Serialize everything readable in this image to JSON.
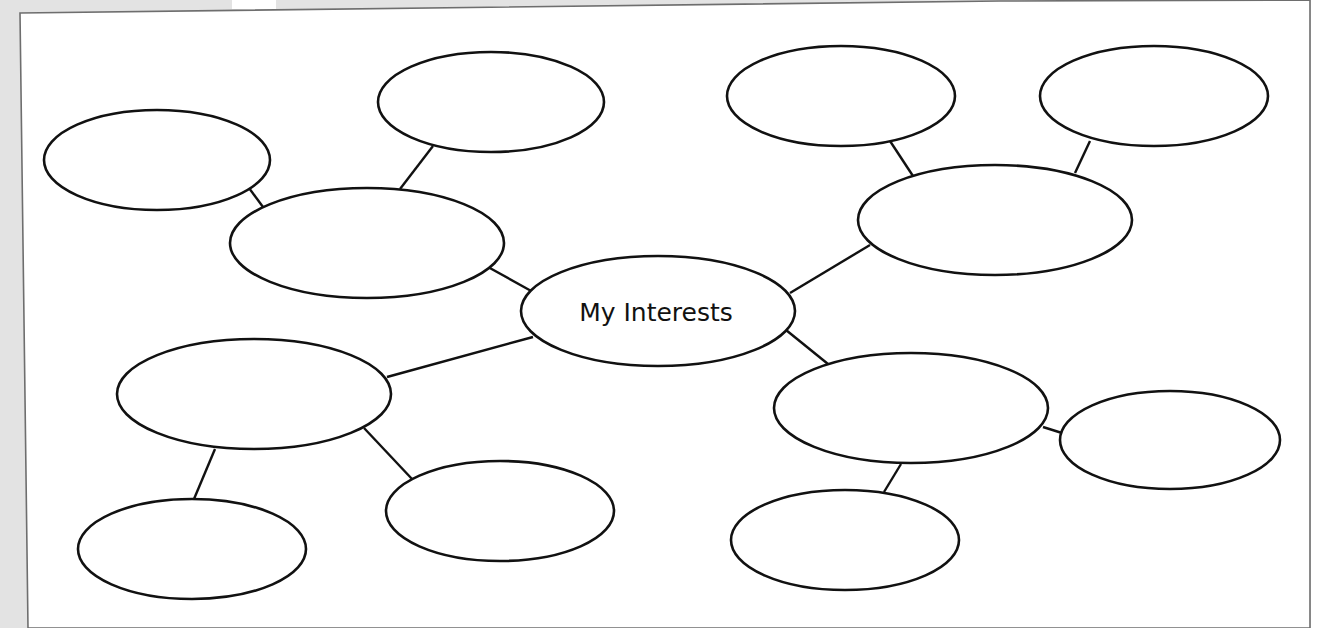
{
  "worksheet": {
    "title": "My Interests",
    "paper_color": "#ffffff",
    "background_color": "#e3e3e3",
    "stroke_color": "#111111"
  },
  "center_node": {
    "label": "My Interests",
    "cx": 658,
    "cy": 311,
    "rx": 137,
    "ry": 55
  },
  "nodes": [
    {
      "id": "top-left",
      "cx": 157,
      "cy": 160,
      "rx": 113,
      "ry": 50,
      "label": ""
    },
    {
      "id": "top-middle",
      "cx": 491,
      "cy": 102,
      "rx": 113,
      "ry": 50,
      "label": ""
    },
    {
      "id": "upper-left-branch",
      "cx": 367,
      "cy": 243,
      "rx": 137,
      "ry": 55,
      "label": ""
    },
    {
      "id": "top-right-a",
      "cx": 841,
      "cy": 96,
      "rx": 114,
      "ry": 50,
      "label": ""
    },
    {
      "id": "top-right-b",
      "cx": 1154,
      "cy": 96,
      "rx": 114,
      "ry": 50,
      "label": ""
    },
    {
      "id": "upper-right-branch",
      "cx": 995,
      "cy": 220,
      "rx": 137,
      "ry": 55,
      "label": ""
    },
    {
      "id": "lower-left-branch",
      "cx": 254,
      "cy": 394,
      "rx": 137,
      "ry": 55,
      "label": ""
    },
    {
      "id": "bottom-left",
      "cx": 192,
      "cy": 549,
      "rx": 114,
      "ry": 50,
      "label": ""
    },
    {
      "id": "bottom-center-left",
      "cx": 500,
      "cy": 511,
      "rx": 114,
      "ry": 50,
      "label": ""
    },
    {
      "id": "lower-right-branch",
      "cx": 911,
      "cy": 408,
      "rx": 137,
      "ry": 55,
      "label": ""
    },
    {
      "id": "far-right",
      "cx": 1170,
      "cy": 440,
      "rx": 110,
      "ry": 49,
      "label": ""
    },
    {
      "id": "bottom-right",
      "cx": 845,
      "cy": 540,
      "rx": 114,
      "ry": 50,
      "label": ""
    }
  ],
  "connectors": [
    {
      "from": "upper-left-branch",
      "to": "center",
      "x1": 488,
      "y1": 267,
      "x2": 533,
      "y2": 292
    },
    {
      "from": "lower-left-branch",
      "to": "center",
      "x1": 387,
      "y1": 377,
      "x2": 533,
      "y2": 337
    },
    {
      "from": "center",
      "to": "upper-right-branch",
      "x1": 790,
      "y1": 293,
      "x2": 870,
      "y2": 245
    },
    {
      "from": "center",
      "to": "lower-right-branch",
      "x1": 786,
      "y1": 330,
      "x2": 828,
      "y2": 364
    },
    {
      "from": "top-left",
      "to": "upper-left-branch",
      "x1": 246,
      "y1": 184,
      "x2": 263,
      "y2": 207
    },
    {
      "from": "top-middle",
      "to": "upper-left-branch",
      "x1": 433,
      "y1": 146,
      "x2": 400,
      "y2": 189
    },
    {
      "from": "top-right-a",
      "to": "upper-right-branch",
      "x1": 890,
      "y1": 141,
      "x2": 913,
      "y2": 176
    },
    {
      "from": "top-right-b",
      "to": "upper-right-branch",
      "x1": 1090,
      "y1": 141,
      "x2": 1075,
      "y2": 173
    },
    {
      "from": "lower-left-branch",
      "to": "bottom-left",
      "x1": 215,
      "y1": 449,
      "x2": 194,
      "y2": 499
    },
    {
      "from": "lower-left-branch",
      "to": "bottom-center-left",
      "x1": 364,
      "y1": 428,
      "x2": 412,
      "y2": 479
    },
    {
      "from": "lower-right-branch",
      "to": "far-right",
      "x1": 1043,
      "y1": 427,
      "x2": 1062,
      "y2": 433
    },
    {
      "from": "lower-right-branch",
      "to": "bottom-right",
      "x1": 901,
      "y1": 464,
      "x2": 884,
      "y2": 492
    }
  ]
}
